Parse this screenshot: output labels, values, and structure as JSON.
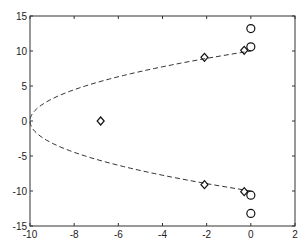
{
  "chart_data": {
    "type": "scatter",
    "title": "",
    "xlabel": "",
    "ylabel": "",
    "xlim": [
      -10,
      2
    ],
    "ylim": [
      -15,
      15
    ],
    "xticks": [
      -10,
      -8,
      -6,
      -4,
      -2,
      0,
      2
    ],
    "yticks": [
      -15,
      -10,
      -5,
      0,
      5,
      10,
      15
    ],
    "grid": false,
    "legend": null,
    "series": [
      {
        "name": "diamonds",
        "marker": "diamond",
        "points": [
          [
            -6.8,
            0
          ],
          [
            -2.1,
            9.1
          ],
          [
            -2.1,
            -9.1
          ],
          [
            -0.3,
            10.1
          ],
          [
            -0.3,
            -10.1
          ]
        ]
      },
      {
        "name": "circles",
        "marker": "circle",
        "points": [
          [
            0,
            13.2
          ],
          [
            0,
            10.6
          ],
          [
            0,
            -10.6
          ],
          [
            0,
            -13.2
          ]
        ]
      },
      {
        "name": "dashed-boundary",
        "style": "dashed-line",
        "equation": "x = -10 + 0.1*y^2",
        "y_range": [
          -10,
          10
        ]
      }
    ]
  }
}
